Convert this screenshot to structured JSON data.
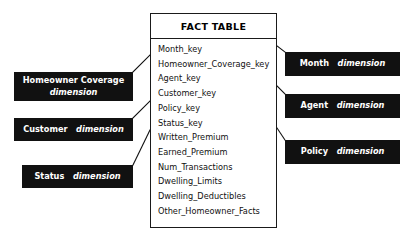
{
  "diagram": {
    "colors": {
      "box_fill": "#111111",
      "box_text": "#ffffff",
      "fact_fill": "#ffffff",
      "fact_border": "#1a1a1a",
      "connector": "#111111"
    }
  },
  "fact_table": {
    "header": "FACT TABLE",
    "fields": [
      "Month_key",
      "Homeowner_Coverage_key",
      "Agent_key",
      "Customer_key",
      "Policy_key",
      "Status_key",
      "Written_Premium",
      "Earned_Premium",
      "Num_Transactions",
      "Dwelling_Limits",
      "Dwelling_Deductibles",
      "Other_Homeowner_Facts"
    ]
  },
  "dimensions": {
    "left": [
      {
        "name": "Homeowner Coverage",
        "suffix": "dimension",
        "two_line": true
      },
      {
        "name": "Customer",
        "suffix": "dimension",
        "two_line": false
      },
      {
        "name": "Status",
        "suffix": "dimension",
        "two_line": false
      }
    ],
    "right": [
      {
        "name": "Month",
        "suffix": "dimension"
      },
      {
        "name": "Agent",
        "suffix": "dimension"
      },
      {
        "name": "Policy",
        "suffix": "dimension"
      }
    ]
  },
  "connectors": [
    {
      "from": "Homeowner Coverage dimension",
      "to": "FACT TABLE"
    },
    {
      "from": "Customer dimension",
      "to": "FACT TABLE"
    },
    {
      "from": "Status dimension",
      "to": "FACT TABLE"
    },
    {
      "from": "FACT TABLE",
      "to": "Month dimension"
    },
    {
      "from": "FACT TABLE",
      "to": "Agent dimension"
    },
    {
      "from": "FACT TABLE",
      "to": "Policy dimension"
    }
  ]
}
